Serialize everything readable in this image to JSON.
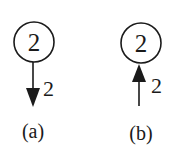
{
  "panels": [
    {
      "caption": "(a)",
      "node_label": "2",
      "edge_label": "2",
      "arrow_direction": "down",
      "description": "Arrow leaving node downward"
    },
    {
      "caption": "(b)",
      "node_label": "2",
      "edge_label": "2",
      "arrow_direction": "up",
      "description": "Arrow entering node from below"
    }
  ],
  "colors": {
    "stroke": "#1a1a1a",
    "background": "#ffffff"
  }
}
